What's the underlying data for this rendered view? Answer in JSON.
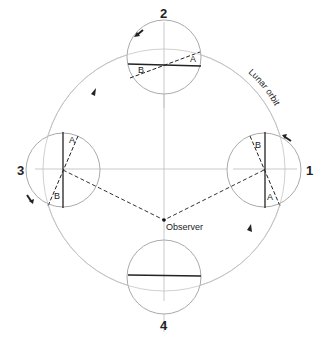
{
  "diagram": {
    "positions": [
      {
        "id": "1",
        "label": "1"
      },
      {
        "id": "2",
        "label": "2"
      },
      {
        "id": "3",
        "label": "3"
      },
      {
        "id": "4",
        "label": "4"
      }
    ],
    "orbit_label": "Lunar orbit",
    "observer_label": "Observer",
    "marker_a": "A",
    "marker_b": "B",
    "colors": {
      "line": "#222222",
      "light_line": "#bbbbbb",
      "background": "#ffffff"
    }
  }
}
